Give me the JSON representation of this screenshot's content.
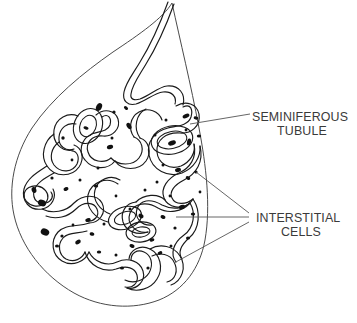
{
  "figure": {
    "background_color": "#ffffff",
    "line_color": "#1a1a1a",
    "outline_color": "#4a4a4a",
    "text_color": "#3a3a3a",
    "cell_fill_color": "#111111",
    "leader_color": "#555555"
  },
  "labels": {
    "seminiferous": {
      "line1": "SEMINIFEROUS",
      "line2": "TUBULE"
    },
    "interstitial": {
      "line1": "INTERSTITIAL",
      "line2": "CELLS"
    }
  },
  "structures": {
    "organ_name": "testis-outline",
    "duct_name": "efferent-duct",
    "tubule_name": "seminiferous-tubule-coil",
    "cells_name": "interstitial-cell-cluster"
  }
}
